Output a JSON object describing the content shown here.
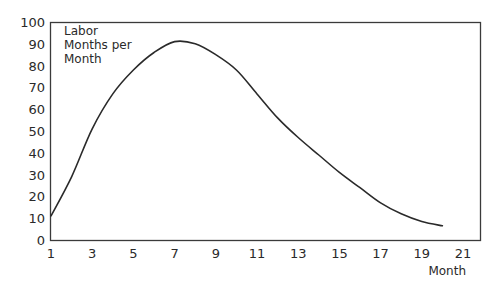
{
  "chart_data": {
    "type": "line",
    "title": "",
    "ylabel_lines": [
      "Labor",
      "Months per",
      "Month"
    ],
    "ylabel": "Labor Months per Month",
    "xlabel": "Month",
    "xlim": [
      1,
      21
    ],
    "ylim": [
      0,
      100
    ],
    "x_ticks": [
      1,
      3,
      5,
      7,
      9,
      11,
      13,
      15,
      17,
      19,
      21
    ],
    "y_ticks": [
      0,
      10,
      20,
      30,
      40,
      50,
      60,
      70,
      80,
      90,
      100
    ],
    "grid": false,
    "legend": null,
    "series": [
      {
        "name": "Labor Months per Month",
        "color": "#2a2a2a",
        "x": [
          1,
          2,
          3,
          4,
          5,
          6,
          7,
          8,
          9,
          10,
          11,
          12,
          13,
          14,
          15,
          16,
          17,
          18,
          19,
          20
        ],
        "values": [
          11,
          29,
          51,
          67,
          78,
          86,
          91,
          90,
          85,
          78,
          67,
          56,
          47,
          39,
          31,
          24,
          17,
          12,
          8.5,
          6.5
        ]
      }
    ]
  }
}
